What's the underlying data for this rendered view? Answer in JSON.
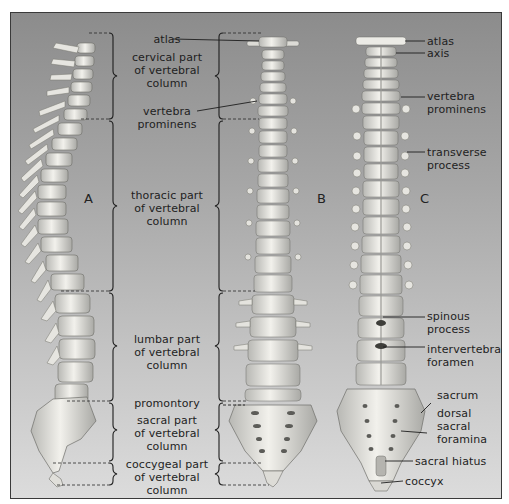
{
  "figure": {
    "views": [
      {
        "id": "A",
        "label": "A",
        "description": "lateral view"
      },
      {
        "id": "B",
        "label": "B",
        "description": "anterior view"
      },
      {
        "id": "C",
        "label": "C",
        "description": "posterior view"
      }
    ],
    "regions": [
      {
        "line1": "cervical part",
        "line2": "of vertebral",
        "line3": "column"
      },
      {
        "line1": "thoracic part",
        "line2": "of vertebral",
        "line3": "column"
      },
      {
        "line1": "lumbar part",
        "line2": "of vertebral",
        "line3": "column"
      },
      {
        "line1": "sacral part",
        "line2": "of vertebral",
        "line3": "column"
      },
      {
        "line1": "coccygeal part",
        "line2": "of vertebral",
        "line3": "column"
      }
    ],
    "center_labels": {
      "atlas": "atlas",
      "vertebra_prominens_1": "vertebra",
      "vertebra_prominens_2": "prominens",
      "promontory": "promontory"
    },
    "right_labels": [
      {
        "lines": [
          "atlas"
        ]
      },
      {
        "lines": [
          "axis"
        ]
      },
      {
        "lines": [
          "vertebra",
          "prominens"
        ]
      },
      {
        "lines": [
          "transverse",
          "process"
        ]
      },
      {
        "lines": [
          "spinous",
          "process"
        ]
      },
      {
        "lines": [
          "intervertebral",
          "foramen"
        ]
      },
      {
        "lines": [
          "sacrum"
        ]
      },
      {
        "lines": [
          "dorsal",
          "sacral",
          "foramina"
        ]
      },
      {
        "lines": [
          "sacral hiatus"
        ]
      },
      {
        "lines": [
          "coccyx"
        ]
      }
    ],
    "colors": {
      "bone": "#ecebe6",
      "bone_shadow": "#9a9a96",
      "background_top": "#8c8c8c",
      "background_bottom": "#dcdcdc",
      "line": "#1e1e1e"
    }
  }
}
